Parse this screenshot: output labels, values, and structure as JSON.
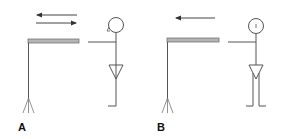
{
  "panels": [
    {
      "label": "A",
      "description": "Bar extended toward figure; bidirectional arrows (reciprocating motion)",
      "arrows": [
        "left",
        "right"
      ],
      "figure_legs": "single"
    },
    {
      "label": "B",
      "description": "Bar extended toward figure; single leftward arrow",
      "arrows": [
        "left"
      ],
      "figure_legs": "double"
    }
  ],
  "colors": {
    "line": "#555555",
    "bar_fill": "#b5b5b5",
    "bar_stroke": "#666666",
    "label": "#111111",
    "background": "#ffffff"
  }
}
